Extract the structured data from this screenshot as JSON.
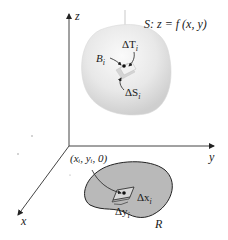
{
  "figure": {
    "surface_label": "S: z = f (x, y)",
    "axes": {
      "z": "z",
      "y": "y",
      "x": "x"
    },
    "surface_annotations": {
      "delta_T": "ΔT",
      "delta_T_sub": "i",
      "point_B": "B",
      "point_B_sub": "i",
      "delta_S": "ΔS",
      "delta_S_sub": "i"
    },
    "region_annotations": {
      "point_label": "(xᵢ, yᵢ, 0)",
      "delta_x": "Δx",
      "delta_x_sub": "i",
      "delta_y": "Δy",
      "delta_y_sub": "i",
      "region": "R"
    },
    "colors": {
      "surface_fill": "#e6e6e6",
      "surface_highlight": "#f7f7f7",
      "region_fill": "#b8b8b8",
      "patch_fill": "#d0d0d0",
      "axis": "#333333"
    }
  }
}
